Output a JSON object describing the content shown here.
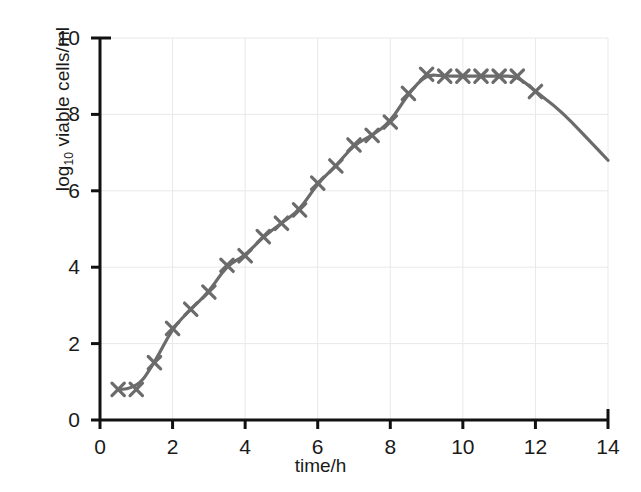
{
  "chart_data": {
    "type": "line",
    "title": "",
    "xlabel": "time/h",
    "ylabel": "log10 viable cells/ml",
    "ylabel_base": "log",
    "ylabel_sub": "10",
    "ylabel_rest": " viable cells/ml",
    "xlim": [
      0,
      14
    ],
    "ylim": [
      0,
      10
    ],
    "xticks": [
      0,
      2,
      4,
      6,
      8,
      10,
      12,
      14
    ],
    "yticks": [
      0,
      2,
      4,
      6,
      8,
      10
    ],
    "grid": true,
    "grid_color": "#e8e8e8",
    "legend": null,
    "series": [
      {
        "name": "viable cell count",
        "color": "#6b6b6b",
        "marker": "x",
        "x": [
          0.5,
          1.0,
          1.5,
          2.0,
          2.5,
          3.0,
          3.5,
          4.0,
          4.5,
          5.0,
          5.5,
          6.0,
          6.5,
          7.0,
          7.5,
          8.0,
          8.5,
          9.0,
          9.5,
          10.0,
          10.5,
          11.0,
          11.5,
          12.0
        ],
        "y": [
          0.8,
          0.8,
          1.5,
          2.4,
          2.9,
          3.35,
          4.05,
          4.3,
          4.8,
          5.15,
          5.5,
          6.2,
          6.65,
          7.2,
          7.45,
          7.8,
          8.55,
          9.05,
          9.0,
          9.0,
          9.0,
          9.0,
          9.0,
          8.6
        ],
        "tail_x": [
          12.0,
          12.5,
          13.0,
          13.5,
          14.0
        ],
        "tail_y": [
          8.6,
          8.25,
          7.8,
          7.3,
          6.8
        ],
        "tail_markers": false
      }
    ],
    "phases": {
      "lag": "0-1 h",
      "exponential": "1-9 h",
      "stationary": "9-11.5 h",
      "death": "12-14 h"
    }
  },
  "axis": {
    "color": "#111111",
    "xtick_labels": [
      "0",
      "2",
      "4",
      "6",
      "8",
      "10",
      "12",
      "14"
    ],
    "ytick_labels": [
      "0",
      "2",
      "4",
      "6",
      "8",
      "10"
    ]
  }
}
